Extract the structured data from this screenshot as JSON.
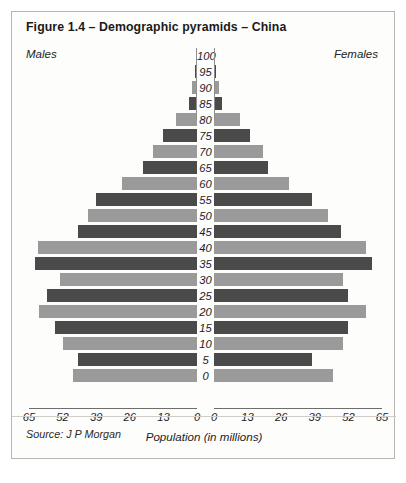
{
  "figure": {
    "title": "Figure 1.4 – Demographic pyramids – China",
    "males_label": "Males",
    "females_label": "Females",
    "axis_caption": "Population (in millions)",
    "source": "Source: J P Morgan"
  },
  "chart_data": {
    "type": "bar",
    "subtype": "population-pyramid",
    "title": "Figure 1.4 – Demographic pyramids – China",
    "xlabel": "Population (in millions)",
    "ylabel": "",
    "xlim": [
      0,
      65
    ],
    "x_ticks_left": [
      "65",
      "52",
      "39",
      "26",
      "13",
      "0"
    ],
    "x_ticks_right": [
      "0",
      "13",
      "26",
      "39",
      "52",
      "65"
    ],
    "grid": false,
    "legend_position": "top (Males left / Females right)",
    "categories": [
      "100",
      "95",
      "90",
      "85",
      "80",
      "75",
      "70",
      "65",
      "60",
      "55",
      "50",
      "45",
      "40",
      "35",
      "30",
      "25",
      "20",
      "15",
      "10",
      "5",
      "0"
    ],
    "series": [
      {
        "name": "Males",
        "side": "left",
        "values": [
          0.4,
          0.8,
          2.0,
          3.0,
          8.0,
          13.0,
          17.0,
          21.0,
          29.0,
          39.0,
          42.0,
          46.0,
          61.5,
          62.7,
          53.0,
          58.0,
          61.0,
          55.0,
          52.0,
          46.0,
          48.0
        ]
      },
      {
        "name": "Females",
        "side": "right",
        "values": [
          0.4,
          0.8,
          2.0,
          3.0,
          10.0,
          14.0,
          19.0,
          21.0,
          29.0,
          38.0,
          44.0,
          49.0,
          59.0,
          61.0,
          50.0,
          52.0,
          59.0,
          52.0,
          50.0,
          38.0,
          46.0
        ]
      }
    ],
    "bar_colors": {
      "dark": "#4a4a4a",
      "light": "#9a9a9a"
    }
  }
}
